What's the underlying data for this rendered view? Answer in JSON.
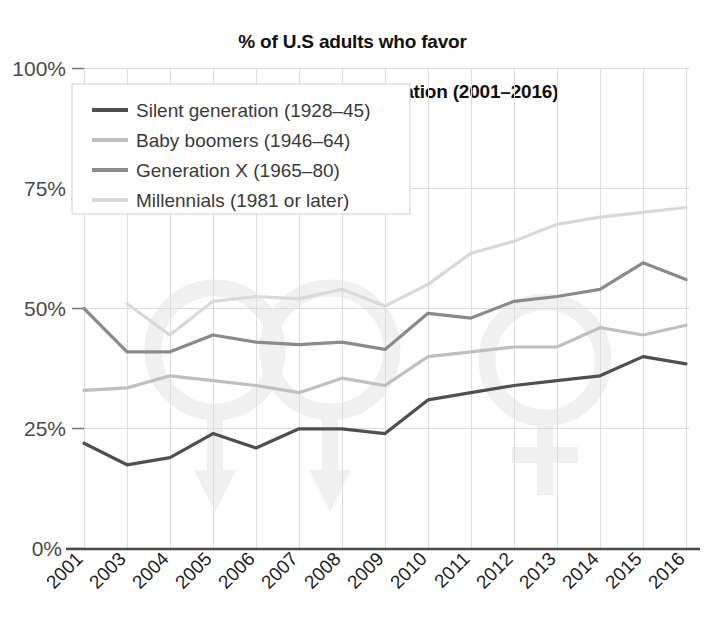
{
  "chart_data": {
    "type": "line",
    "title": "% of U.S adults who favor\nsame-sex marriage, by generation (2001–2016)",
    "title_line1": "% of U.S adults who favor",
    "title_line2": "same-sex marriage, by generation (2001–2016)",
    "xlabel": "",
    "ylabel": "",
    "grid": true,
    "legend_position": "top-left",
    "ylim": [
      0,
      100
    ],
    "ytick_labels": [
      "0%",
      "25%",
      "50%",
      "75%",
      "100%"
    ],
    "ytick_values": [
      0,
      25,
      50,
      75,
      100
    ],
    "categories": [
      "2001",
      "2003",
      "2004",
      "2005",
      "2006",
      "2007",
      "2008",
      "2009",
      "2010",
      "2011",
      "2012",
      "2013",
      "2014",
      "2015",
      "2016"
    ],
    "x": [
      2001,
      2003,
      2004,
      2005,
      2006,
      2007,
      2008,
      2009,
      2010,
      2011,
      2012,
      2013,
      2014,
      2015,
      2016
    ],
    "series": [
      {
        "name": "Silent generation (1928–45)",
        "color": "#4f4f4f",
        "values": [
          22,
          17.5,
          19,
          24,
          21,
          25,
          25,
          24,
          31,
          32.5,
          34,
          35,
          36,
          40,
          38.5
        ]
      },
      {
        "name": "Baby boomers (1946–64)",
        "color": "#bfbfbf",
        "values": [
          33,
          33.5,
          36,
          35,
          34,
          32.5,
          35.5,
          34,
          40,
          41,
          42,
          42,
          46,
          44.5,
          46.5
        ]
      },
      {
        "name": "Generation X (1965–80)",
        "color": "#8a8a8a",
        "values": [
          50,
          41,
          41,
          44.5,
          43,
          42.5,
          43,
          41.5,
          49,
          48,
          51.5,
          52.5,
          54,
          59.5,
          56
        ]
      },
      {
        "name": "Millennials (1981 or later)",
        "color": "#d8d8d8",
        "values": [
          null,
          51,
          44.5,
          51.5,
          52.5,
          52,
          54,
          50.5,
          55,
          61.5,
          64,
          67.5,
          69,
          70,
          71
        ]
      }
    ],
    "colors": {
      "silent": "#4f4f4f",
      "baby_boomers": "#bfbfbf",
      "generation_x": "#8a8a8a",
      "millennials": "#d8d8d8",
      "gridline": "#d6d6d6",
      "axis": "#444444",
      "background": "#ffffff",
      "watermark": "#f1f1f1",
      "legend_border": "#cccccc",
      "tick_text": "#4a4a4a"
    }
  },
  "legend": {
    "items": [
      {
        "label": "Silent generation (1928–45)",
        "color": "#4f4f4f"
      },
      {
        "label": "Baby boomers (1946–64)",
        "color": "#bfbfbf"
      },
      {
        "label": "Generation X (1965–80)",
        "color": "#8a8a8a"
      },
      {
        "label": "Millennials (1981 or later)",
        "color": "#d8d8d8"
      }
    ]
  },
  "watermark": {
    "name": "gender-symbols-watermark",
    "description": "interlocking male and female gender symbols"
  }
}
